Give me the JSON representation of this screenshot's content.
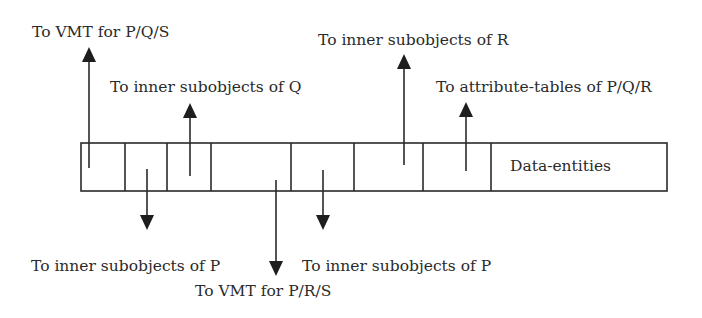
{
  "diagram": {
    "record": {
      "cells": [
        "",
        "",
        "",
        "",
        "",
        "",
        "",
        "Data-entities"
      ],
      "last_cell_label": "Data-entities"
    },
    "pointers": [
      {
        "id": "p1",
        "direction": "up",
        "label": "To VMT for P/Q/S"
      },
      {
        "id": "p2",
        "direction": "down",
        "label": "To inner subobjects of P"
      },
      {
        "id": "p3",
        "direction": "up",
        "label": "To inner subobjects of Q"
      },
      {
        "id": "p4",
        "direction": "down",
        "label": "To VMT for P/R/S"
      },
      {
        "id": "p5",
        "direction": "down",
        "label": "To inner subobjects of P"
      },
      {
        "id": "p6",
        "direction": "up",
        "label": "To inner subobjects of R"
      },
      {
        "id": "p7",
        "direction": "up",
        "label": "To attribute-tables of P/Q/R"
      }
    ],
    "colors": {
      "line": "#2a2a2a",
      "background": "#ffffff"
    }
  }
}
